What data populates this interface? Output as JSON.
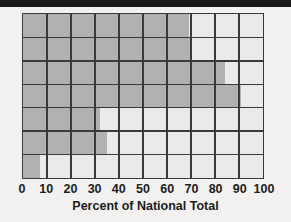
{
  "figure": {
    "top_rule_color": "#1a1a1a",
    "background_color": "#f2f1ef",
    "plot_background_color": "#eceae8",
    "bar_color": "#b2b1af",
    "grid_color": "#3a3a3a"
  },
  "chart_data": {
    "type": "bar",
    "orientation": "horizontal",
    "title": "",
    "subtitle": "",
    "xlabel": "Percent of National Total",
    "ylabel": "",
    "xlim": [
      0,
      100
    ],
    "xticks": [
      0,
      10,
      20,
      30,
      40,
      50,
      60,
      70,
      80,
      90,
      100
    ],
    "xtick_labels": [
      "0",
      "10",
      "20",
      "30",
      "40",
      "50",
      "60",
      "70",
      "80",
      "90",
      "100"
    ],
    "categories": [
      "",
      "",
      "",
      "",
      "",
      "",
      ""
    ],
    "values": [
      69,
      70,
      84,
      91,
      32,
      35,
      7
    ],
    "grid": true,
    "grid_axis": "both",
    "legend": null,
    "annotations": []
  }
}
